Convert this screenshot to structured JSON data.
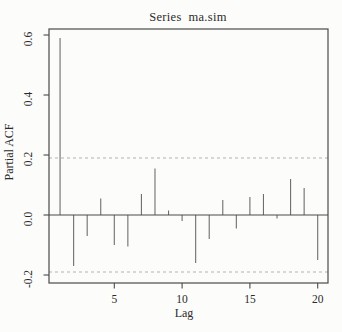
{
  "chart_data": {
    "type": "bar",
    "subtype": "stem-pacf",
    "title": "Series  ma.sim",
    "xlabel": "Lag",
    "ylabel": "Partial ACF",
    "x": [
      1,
      2,
      3,
      4,
      5,
      6,
      7,
      8,
      9,
      10,
      11,
      12,
      13,
      14,
      15,
      16,
      17,
      18,
      19,
      20
    ],
    "values": [
      0.59,
      -0.17,
      -0.07,
      0.055,
      -0.1,
      -0.105,
      0.07,
      0.155,
      0.015,
      -0.02,
      -0.16,
      -0.08,
      0.05,
      -0.045,
      0.06,
      0.07,
      -0.012,
      0.12,
      0.09,
      -0.15
    ],
    "confidence_bands": [
      0.19,
      -0.19
    ],
    "zero_line": 0.0,
    "x_ticks": [
      5,
      10,
      15,
      20
    ],
    "x_tick_labels": [
      "5",
      "10",
      "15",
      "20"
    ],
    "y_ticks": [
      -0.2,
      0.0,
      0.2,
      0.4,
      0.6
    ],
    "y_tick_labels": [
      "-0.2",
      "0.0",
      "0.2",
      "0.4",
      "0.6"
    ],
    "ylim": [
      -0.2267,
      0.62
    ],
    "xlim": [
      0.18,
      20.76
    ],
    "grid": "off",
    "legend": "none",
    "colors": {
      "background": "#fcfcfa",
      "frame": "#4a4a4a",
      "bar": "#6e6e6e",
      "zero_line": "#4a4a4a",
      "confidence_dash": "#b2b2b2",
      "text": "#2b2b2b"
    }
  }
}
